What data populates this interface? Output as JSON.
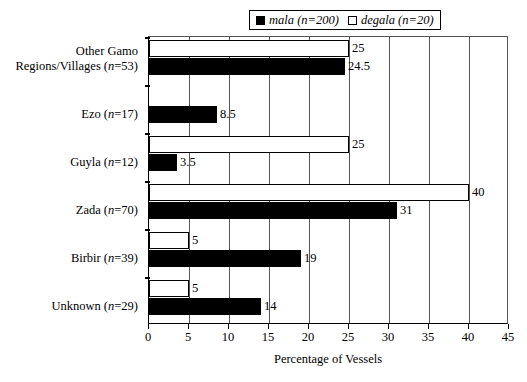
{
  "chart_data": {
    "type": "bar",
    "orientation": "horizontal",
    "title": "",
    "xlabel": "Percentage of Vessels",
    "ylabel": "",
    "xlim": [
      0,
      45
    ],
    "xticks": [
      0,
      5,
      10,
      15,
      20,
      25,
      30,
      35,
      40,
      45
    ],
    "grid": true,
    "legend_position": "top-center",
    "categories": [
      "Other Gamo Regions/Villages (n=53)",
      "Ezo (n=17)",
      "Guyla (n=12)",
      "Zada (n=70)",
      "Birbir (n=39)",
      "Unknown (n=29)"
    ],
    "series": [
      {
        "name": "mala (n=200)",
        "color": "#000000",
        "values": [
          24.5,
          8.5,
          3.5,
          31,
          19,
          14
        ],
        "labels": [
          "24.5",
          "8.5",
          "3.5",
          "31",
          "19",
          "14"
        ]
      },
      {
        "name": "degala (n=20)",
        "color": "#ffffff",
        "values": [
          25,
          0,
          25,
          40,
          5,
          5
        ],
        "labels": [
          "25",
          "",
          "25",
          "40",
          "5",
          "5"
        ]
      }
    ]
  },
  "legend": {
    "entries": [
      {
        "label": "mala (n=200)",
        "swatch": "filled"
      },
      {
        "label": "degala (n=20)",
        "swatch": "hollow"
      }
    ]
  },
  "axis": {
    "x_title": "Percentage of Vessels",
    "tick_labels": [
      "0",
      "5",
      "10",
      "15",
      "20",
      "25",
      "30",
      "35",
      "40",
      "45"
    ]
  },
  "categories_display": [
    {
      "line1": "Other Gamo",
      "line2": "Regions/Villages (",
      "italic": "n",
      "line2b": "=53)"
    },
    {
      "line1": "",
      "line2": "Ezo (",
      "italic": "n",
      "line2b": "=17)"
    },
    {
      "line1": "",
      "line2": "Guyla (",
      "italic": "n",
      "line2b": "=12)"
    },
    {
      "line1": "",
      "line2": "Zada (",
      "italic": "n",
      "line2b": "=70)"
    },
    {
      "line1": "",
      "line2": "Birbir (",
      "italic": "n",
      "line2b": "=39)"
    },
    {
      "line1": "",
      "line2": "Unknown (",
      "italic": "n",
      "line2b": "=29)"
    }
  ],
  "colors": {
    "mala": "#000000",
    "degala": "#ffffff",
    "axis": "#000000",
    "grid": "#555555",
    "background": "#ffffff"
  }
}
